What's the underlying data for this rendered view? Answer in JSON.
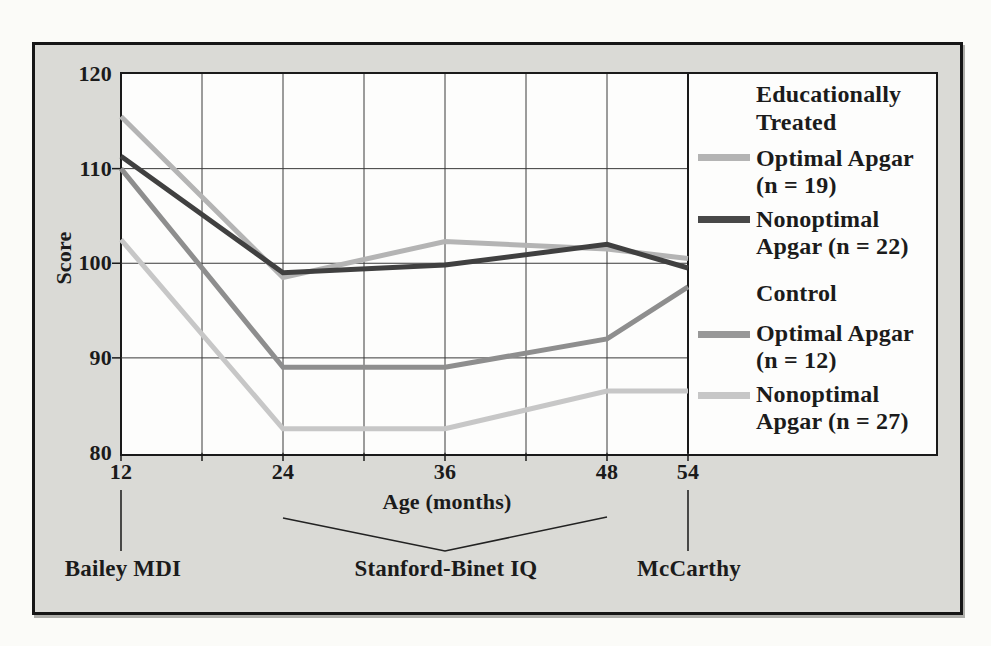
{
  "chart_data": {
    "type": "line",
    "title": "",
    "xlabel": "Age (months)",
    "ylabel": "Score",
    "x": [
      12,
      24,
      36,
      48,
      54
    ],
    "xlim": [
      12,
      54
    ],
    "ylim": [
      80,
      120
    ],
    "x_ticks": [
      12,
      24,
      36,
      48,
      54
    ],
    "y_ticks": [
      120,
      110,
      100,
      90,
      80
    ],
    "x_gridline_step_months": 6,
    "grid": true,
    "series": [
      {
        "name": "Educationally Treated - Optimal Apgar (n = 19)",
        "color": "#b4b4b4",
        "values": [
          115.5,
          98.5,
          102.3,
          101.5,
          100.5
        ]
      },
      {
        "name": "Educationally Treated - Nonoptimal Apgar (n = 22)",
        "color": "#404040",
        "values": [
          111.3,
          99,
          99.8,
          102,
          99.5
        ]
      },
      {
        "name": "Control - Optimal Apgar (n = 12)",
        "color": "#8e8e8e",
        "values": [
          110,
          89,
          89,
          92,
          97.5
        ]
      },
      {
        "name": "Control - Nonoptimal Apgar (n = 27)",
        "color": "#c7c7c7",
        "values": [
          102.5,
          82.5,
          82.5,
          86.5,
          86.5
        ]
      }
    ],
    "legend": {
      "position": "right",
      "groups": [
        {
          "header": "Educationally\nTreated",
          "items": [
            {
              "swatch_color": "#b4b4b4",
              "label": "Optimal Apgar\n(n = 19)"
            },
            {
              "swatch_color": "#484848",
              "label": "Nonoptimal\nApgar (n = 22)"
            }
          ]
        },
        {
          "header": "Control",
          "items": [
            {
              "swatch_color": "#989898",
              "label": "Optimal Apgar\n(n = 12)"
            },
            {
              "swatch_color": "#c7c7c7",
              "label": "Nonoptimal\nApgar (n = 27)"
            }
          ]
        }
      ]
    },
    "axis_annotations": [
      {
        "label": "Bailey MDI",
        "months": [
          12
        ]
      },
      {
        "label": "Stanford-Binet IQ",
        "months": [
          24,
          48
        ]
      },
      {
        "label": "McCarthy",
        "months": [
          54
        ]
      }
    ]
  },
  "colors": {
    "frame_background": "#dadad6",
    "plot_background": "#fdfdfc",
    "border": "#1a1a1a",
    "gridline": "#3a3a3a",
    "text": "#1b1b1b"
  }
}
